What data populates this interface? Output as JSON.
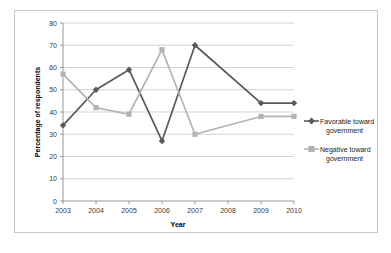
{
  "chart_data": {
    "type": "line",
    "title": "",
    "subtitle": "",
    "xlabel": "Year",
    "ylabel": "Percentage of respondents",
    "categories": [
      "2003",
      "2004",
      "2005",
      "2006",
      "2007",
      "2008",
      "2009",
      "2010"
    ],
    "x": [
      2003,
      2004,
      2005,
      2006,
      2007,
      2008,
      2009,
      2010
    ],
    "xlim": [
      2003,
      2010
    ],
    "ylim": [
      0,
      80
    ],
    "yticks": [
      0,
      10,
      20,
      30,
      40,
      50,
      60,
      70,
      80
    ],
    "ytick_labels": [
      "0",
      "10",
      "20",
      "30",
      "40",
      "50",
      "60",
      "70",
      "80"
    ],
    "xtick_labels": [
      "2003",
      "2004",
      "2005",
      "2006",
      "2007",
      "2008",
      "2009",
      "2010"
    ],
    "grid": "horizontal",
    "legend_position": "right",
    "series": [
      {
        "name": "Favorable toward government",
        "marker": "diamond",
        "color": "#595959",
        "x": [
          2003,
          2004,
          2005,
          2006,
          2007,
          2009,
          2010
        ],
        "values": [
          34,
          50,
          59,
          27,
          70,
          44,
          44
        ]
      },
      {
        "name": "Negative toward government",
        "marker": "square",
        "color": "#b3b3b3",
        "x": [
          2003,
          2004,
          2005,
          2006,
          2007,
          2009,
          2010
        ],
        "values": [
          57,
          42,
          39,
          68,
          30,
          38,
          38
        ]
      }
    ]
  },
  "legend": {
    "entries": [
      {
        "label_line1": "Favorable toward",
        "label_line2": "government",
        "color": "#595959",
        "marker": "diamond"
      },
      {
        "label_line1": "Negative toward",
        "label_line2": "government",
        "color": "#b3b3b3",
        "marker": "square"
      }
    ]
  },
  "colors": {
    "favorable": "#595959",
    "negative": "#b3b3b3",
    "grid": "#bfbfbf",
    "axis": "#8a8a8a",
    "frame_border": "#c9c9c9",
    "background": "#ffffff"
  }
}
